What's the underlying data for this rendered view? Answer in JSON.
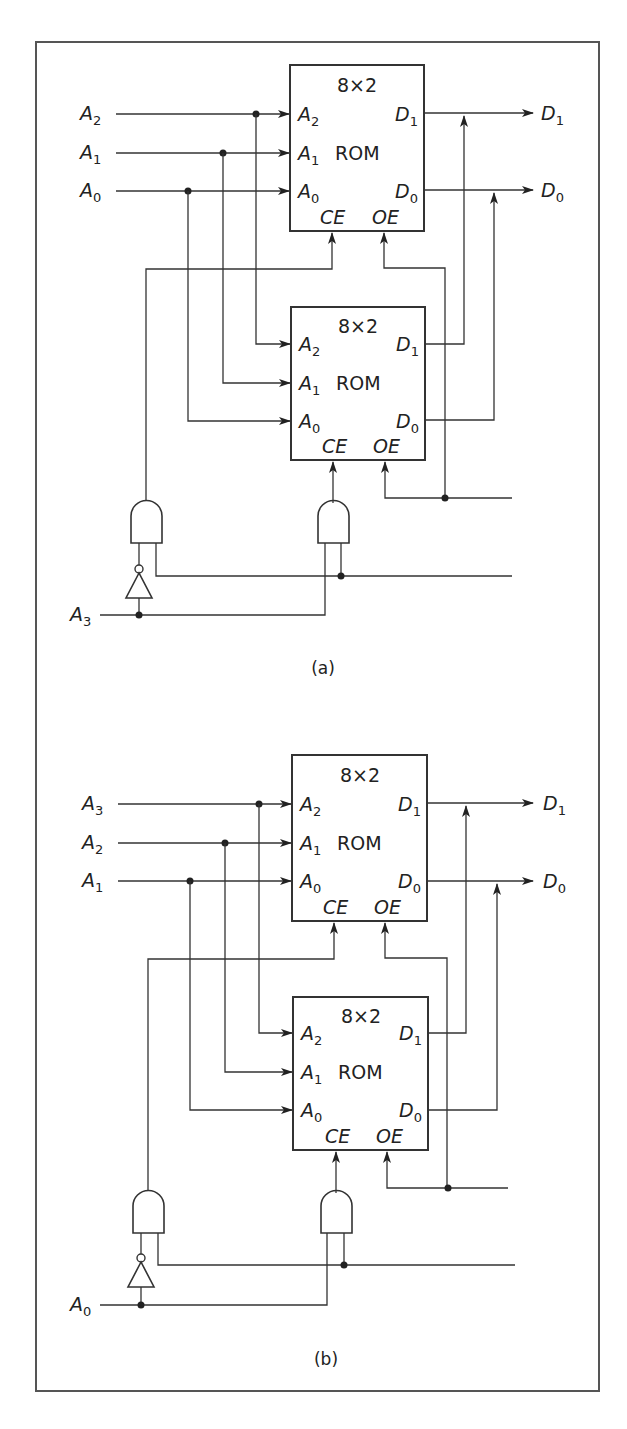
{
  "figure": {
    "panels": [
      {
        "caption": "(a)",
        "inputs": [
          {
            "name": "A",
            "sub": "2"
          },
          {
            "name": "A",
            "sub": "1"
          },
          {
            "name": "A",
            "sub": "0"
          }
        ],
        "select_input": {
          "name": "A",
          "sub": "3"
        },
        "rom_top": {
          "size": "8×2",
          "type": "ROM",
          "pins_in": [
            {
              "name": "A",
              "sub": "2"
            },
            {
              "name": "A",
              "sub": "1"
            },
            {
              "name": "A",
              "sub": "0"
            }
          ],
          "pins_out": [
            {
              "name": "D",
              "sub": "1"
            },
            {
              "name": "D",
              "sub": "0"
            }
          ],
          "ce": "CE",
          "oe": "OE"
        },
        "rom_bottom": {
          "size": "8×2",
          "type": "ROM",
          "pins_in": [
            {
              "name": "A",
              "sub": "2"
            },
            {
              "name": "A",
              "sub": "1"
            },
            {
              "name": "A",
              "sub": "0"
            }
          ],
          "pins_out": [
            {
              "name": "D",
              "sub": "1"
            },
            {
              "name": "D",
              "sub": "0"
            }
          ],
          "ce": "CE",
          "oe": "OE"
        },
        "outputs": [
          {
            "name": "D",
            "sub": "1"
          },
          {
            "name": "D",
            "sub": "0"
          }
        ]
      },
      {
        "caption": "(b)",
        "inputs": [
          {
            "name": "A",
            "sub": "3"
          },
          {
            "name": "A",
            "sub": "2"
          },
          {
            "name": "A",
            "sub": "1"
          }
        ],
        "select_input": {
          "name": "A",
          "sub": "0"
        },
        "rom_top": {
          "size": "8×2",
          "type": "ROM",
          "pins_in": [
            {
              "name": "A",
              "sub": "2"
            },
            {
              "name": "A",
              "sub": "1"
            },
            {
              "name": "A",
              "sub": "0"
            }
          ],
          "pins_out": [
            {
              "name": "D",
              "sub": "1"
            },
            {
              "name": "D",
              "sub": "0"
            }
          ],
          "ce": "CE",
          "oe": "OE"
        },
        "rom_bottom": {
          "size": "8×2",
          "type": "ROM",
          "pins_in": [
            {
              "name": "A",
              "sub": "2"
            },
            {
              "name": "A",
              "sub": "1"
            },
            {
              "name": "A",
              "sub": "0"
            }
          ],
          "pins_out": [
            {
              "name": "D",
              "sub": "1"
            },
            {
              "name": "D",
              "sub": "0"
            }
          ],
          "ce": "CE",
          "oe": "OE"
        },
        "outputs": [
          {
            "name": "D",
            "sub": "1"
          },
          {
            "name": "D",
            "sub": "0"
          }
        ]
      }
    ]
  }
}
